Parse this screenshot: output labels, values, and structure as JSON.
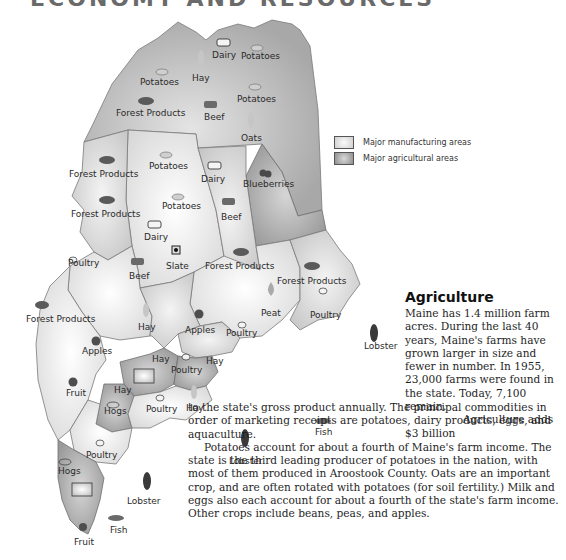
{
  "header": {
    "title": "ECONOMY AND RESOURCES"
  },
  "legend": {
    "items": [
      {
        "label": "Major manufacturing areas",
        "swatch": "light-gradient"
      },
      {
        "label": "Major agricultural areas",
        "swatch": "dark-gradient"
      }
    ]
  },
  "map": {
    "labels": [
      {
        "text": "Dairy",
        "icon": "cow-icon"
      },
      {
        "text": "Potatoes",
        "icon": "potato-icon"
      },
      {
        "text": "Hay",
        "icon": "wheat-icon"
      },
      {
        "text": "Potatoes",
        "icon": "potato-icon"
      },
      {
        "text": "Beef",
        "icon": "cattle-icon"
      },
      {
        "text": "Potatoes",
        "icon": "potato-icon"
      },
      {
        "text": "Forest Products",
        "icon": "logs-icon"
      },
      {
        "text": "Oats",
        "icon": "wheat-icon"
      },
      {
        "text": "Forest Products",
        "icon": "logs-icon"
      },
      {
        "text": "Potatoes",
        "icon": "potato-icon"
      },
      {
        "text": "Dairy",
        "icon": "cow-icon"
      },
      {
        "text": "Blueberries",
        "icon": "berries-icon"
      },
      {
        "text": "Potatoes",
        "icon": "potato-icon"
      },
      {
        "text": "Beef",
        "icon": "cattle-icon"
      },
      {
        "text": "Forest Products",
        "icon": "logs-icon"
      },
      {
        "text": "Dairy",
        "icon": "cow-icon"
      },
      {
        "text": "Poultry",
        "icon": "chicken-icon"
      },
      {
        "text": "Slate",
        "icon": "slate-icon"
      },
      {
        "text": "Forest Products",
        "icon": "logs-icon"
      },
      {
        "text": "Beef",
        "icon": "cattle-icon"
      },
      {
        "text": "Forest Products",
        "icon": "logs-icon"
      },
      {
        "text": "Forest Products",
        "icon": "logs-icon"
      },
      {
        "text": "Peat",
        "icon": "flame-icon"
      },
      {
        "text": "Poultry",
        "icon": "chicken-icon"
      },
      {
        "text": "Hay",
        "icon": "wheat-icon"
      },
      {
        "text": "Apples",
        "icon": "apple-icon"
      },
      {
        "text": "Apples",
        "icon": "apple-icon"
      },
      {
        "text": "Poultry",
        "icon": "chicken-icon"
      },
      {
        "text": "Lobster",
        "icon": "lobster-icon"
      },
      {
        "text": "Hay",
        "icon": "wheat-icon"
      },
      {
        "text": "Hay",
        "icon": "wheat-icon"
      },
      {
        "text": "Poultry",
        "icon": "chicken-icon"
      },
      {
        "text": "Fish",
        "icon": "fish-icon"
      },
      {
        "text": "Fruit",
        "icon": "apple-icon"
      },
      {
        "text": "Hay",
        "icon": "wheat-icon"
      },
      {
        "text": "Hogs",
        "icon": "pig-icon"
      },
      {
        "text": "Poultry",
        "icon": "chicken-icon"
      },
      {
        "text": "Hay",
        "icon": "wheat-icon"
      },
      {
        "text": "Lobster",
        "icon": "lobster-icon"
      },
      {
        "text": "Poultry",
        "icon": "chicken-icon"
      },
      {
        "text": "Hogs",
        "icon": "pig-icon"
      },
      {
        "text": "Lobster",
        "icon": "lobster-icon"
      },
      {
        "text": "Fish",
        "icon": "fish-icon"
      },
      {
        "text": "Fruit",
        "icon": "apple-icon"
      }
    ]
  },
  "article": {
    "title": "Agriculture",
    "p1": "Maine has 1.4 million farm acres. During the last 40 years, Maine's farms have grown larger in size and fewer in number. In 1955, 23,000 farms were found in the state. Today, 7,100 remain.",
    "p2_start": "Agriculture adds $3 billion",
    "p2_rest": "to the state's gross product annually. The principal commodities in order of marketing receipts are potatoes, dairy products, eggs, and aquaculture.",
    "p3": "Potatoes account for about a fourth of Maine's farm income. The state is the third leading producer of potatoes in the nation, with most of them produced in Aroostook County. Oats are an important crop, and are often rotated with potatoes (for soil fertility.) Milk and eggs also each account for about a fourth of the state's farm income. Other crops include beans, peas, and apples."
  },
  "colors": {
    "agri_dark": "#9a9a9a",
    "manu_light": "#f2f2f2",
    "county_mid": "#d4d4d4",
    "county_light": "#e6e6e6",
    "border": "#6e6e6e"
  }
}
